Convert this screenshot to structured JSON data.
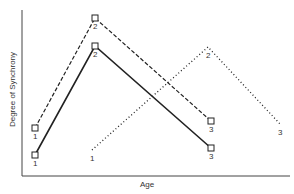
{
  "chart_data": {
    "type": "line",
    "title": "",
    "xlabel": "Age",
    "ylabel": "Degree of Synchrony",
    "grid": false,
    "legend": "none",
    "x_ticks": [],
    "y_ticks": [],
    "series": [
      {
        "name": "dashed",
        "style": "dashed",
        "markers": "square",
        "points": [
          {
            "label": "1",
            "px": [
              35,
              128
            ]
          },
          {
            "label": "2",
            "px": [
              95,
              18
            ]
          },
          {
            "label": "3",
            "px": [
              211,
              121
            ]
          }
        ]
      },
      {
        "name": "solid",
        "style": "solid",
        "markers": "square",
        "points": [
          {
            "label": "1",
            "px": [
              35,
              155
            ]
          },
          {
            "label": "2",
            "px": [
              95,
              46
            ]
          },
          {
            "label": "3",
            "px": [
              211,
              148
            ]
          }
        ]
      },
      {
        "name": "dotted",
        "style": "dotted",
        "markers": "none",
        "points": [
          {
            "label": "1",
            "px": [
              92,
              150
            ]
          },
          {
            "label": "2",
            "px": [
              208,
              47
            ]
          },
          {
            "label": "3",
            "px": [
              280,
              124
            ]
          }
        ]
      }
    ]
  },
  "axes": {
    "y_label": "Degree of Synchrony",
    "x_label": "Age"
  }
}
